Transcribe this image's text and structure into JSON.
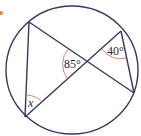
{
  "diagram": {
    "type": "circle-geometry",
    "colors": {
      "circle": "#3b3566",
      "lines": "#3b3566",
      "arc": "#d9846a",
      "marker": "#e08a3c",
      "text": "#2a2a3a"
    },
    "labels": {
      "angle_center": "85°",
      "angle_top_right": "40°",
      "angle_bottom_left": "x"
    },
    "points": {
      "A_top_left": [
        29,
        22
      ],
      "B_bottom_left": [
        25,
        117
      ],
      "C_top_right": [
        121,
        31
      ],
      "D_bottom_right": [
        134,
        93
      ],
      "P_intersection": [
        87,
        62
      ]
    }
  }
}
